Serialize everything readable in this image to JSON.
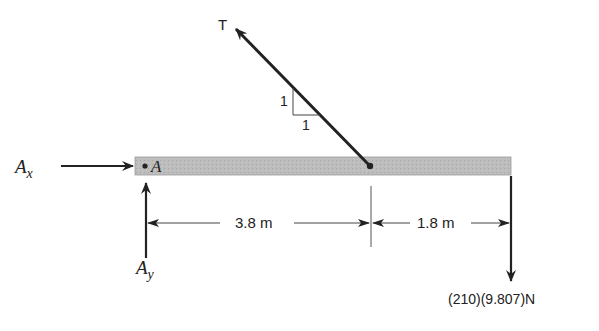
{
  "diagram": {
    "type": "free-body diagram",
    "beam": {
      "point_label": "A",
      "color": "#b9b9b9"
    },
    "forces": {
      "tension": {
        "label": "T",
        "slope": {
          "rise": "1",
          "run": "1"
        }
      },
      "ax": {
        "label_main": "A",
        "label_sub": "x"
      },
      "ay": {
        "label_main": "A",
        "label_sub": "y"
      },
      "weight": {
        "label": "(210)(9.807)N"
      }
    },
    "dimensions": {
      "left": "3.8 m",
      "right": "1.8 m"
    }
  }
}
